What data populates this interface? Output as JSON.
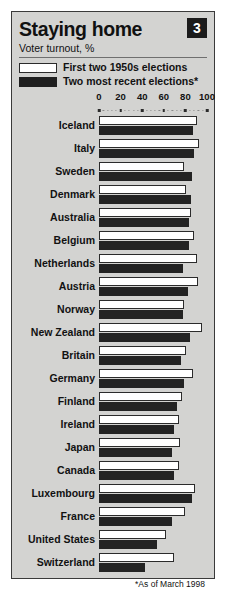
{
  "header": {
    "title": "Staying home",
    "subtitle": "Voter turnout, %",
    "badge": "3"
  },
  "legend": [
    {
      "key": "light",
      "label": "First two 1950s elections",
      "color": "#ffffff"
    },
    {
      "key": "dark",
      "label": "Two most recent elections*",
      "color": "#232323"
    }
  ],
  "footnote": "*As of March 1998",
  "chart_data": {
    "type": "bar",
    "orientation": "horizontal",
    "title": "Staying home",
    "subtitle": "Voter turnout, %",
    "xlabel": "",
    "ylabel": "",
    "xlim": [
      0,
      100
    ],
    "ticks": [
      0,
      20,
      40,
      60,
      80,
      100
    ],
    "grid": false,
    "legend_position": "top",
    "categories": [
      "Iceland",
      "Italy",
      "Sweden",
      "Denmark",
      "Australia",
      "Belgium",
      "Netherlands",
      "Austria",
      "Norway",
      "New Zealand",
      "Britain",
      "Germany",
      "Finland",
      "Ireland",
      "Japan",
      "Canada",
      "Luxembourg",
      "France",
      "United States",
      "Switzerland"
    ],
    "series": [
      {
        "name": "First two 1950s elections",
        "color": "#ffffff",
        "values": [
          91,
          93,
          79,
          81,
          85,
          88,
          91,
          92,
          79,
          95,
          81,
          87,
          77,
          74,
          75,
          74,
          89,
          80,
          62,
          69
        ]
      },
      {
        "name": "Two most recent elections*",
        "color": "#232323",
        "values": [
          87,
          88,
          86,
          85,
          83,
          83,
          78,
          82,
          78,
          84,
          76,
          79,
          72,
          69,
          68,
          69,
          86,
          68,
          54,
          43
        ]
      }
    ]
  }
}
